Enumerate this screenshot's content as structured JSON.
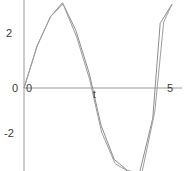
{
  "figure": {
    "background_color": "#ffffff",
    "axis_color": "#9a9a9a",
    "label_color": "#3a3a3a"
  },
  "axes": {
    "x_label": "t",
    "y_label": "",
    "x_ticks": [
      "0",
      "5"
    ],
    "y_ticks": [
      "2",
      "0",
      "-2"
    ],
    "origin_label": "0",
    "x_right_label": "5",
    "y_upper_label": "2",
    "y_lower_label": "-2"
  },
  "chart_data": {
    "type": "line",
    "title": "",
    "subtitle": "",
    "xlabel": "t",
    "ylabel": "",
    "xlim": [
      0,
      5
    ],
    "ylim": [
      -4.2,
      3.6
    ],
    "grid": false,
    "legend": "none",
    "x_tick_values": [
      0,
      5
    ],
    "y_tick_values": [
      -2,
      0,
      2
    ],
    "annotations": [],
    "series": [
      {
        "name": "curve-1",
        "color": "#8c8c8c",
        "x": [
          0.0,
          0.45,
          0.9,
          1.3,
          1.75,
          2.2,
          2.6,
          3.05,
          3.5,
          3.9,
          4.35,
          4.6,
          5.0
        ],
        "y": [
          0.0,
          1.55,
          2.6,
          3.1,
          2.1,
          0.55,
          -1.35,
          -2.6,
          -3.0,
          -3.1,
          -1.1,
          2.35,
          3.05
        ]
      },
      {
        "name": "curve-2",
        "color": "#9e9e9e",
        "x": [
          0.0,
          0.45,
          0.9,
          1.32,
          1.78,
          2.22,
          2.62,
          3.08,
          3.55,
          3.98,
          4.42,
          4.72,
          5.0
        ],
        "y": [
          0.0,
          1.55,
          2.6,
          3.05,
          1.85,
          0.3,
          -1.6,
          -2.75,
          -3.05,
          -3.1,
          -0.85,
          2.4,
          3.05
        ]
      }
    ]
  }
}
